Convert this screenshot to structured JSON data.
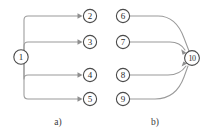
{
  "figure": {
    "width": 209,
    "height": 133,
    "background_color": "#ffffff",
    "node_stroke_color": "#4a4a4a",
    "edge_color": "#9a9a9a",
    "text_color": "#2b2b2b"
  },
  "panels": [
    {
      "id": "panel-a",
      "caption": "a)",
      "caption_x": 58,
      "caption_y": 122
    },
    {
      "id": "panel-b",
      "caption": "b)",
      "caption_x": 155,
      "caption_y": 122
    }
  ],
  "nodes": [
    {
      "id": "n1",
      "label": "1",
      "cx": 21,
      "cy": 57,
      "r": 7.2,
      "panel": "a"
    },
    {
      "id": "n2",
      "label": "2",
      "cx": 90,
      "cy": 16,
      "r": 6.6,
      "panel": "a"
    },
    {
      "id": "n3",
      "label": "3",
      "cx": 90,
      "cy": 42,
      "r": 6.6,
      "panel": "a"
    },
    {
      "id": "n4",
      "label": "4",
      "cx": 90,
      "cy": 75,
      "r": 6.6,
      "panel": "a"
    },
    {
      "id": "n5",
      "label": "5",
      "cx": 90,
      "cy": 99,
      "r": 6.6,
      "panel": "a"
    },
    {
      "id": "n6",
      "label": "6",
      "cx": 123,
      "cy": 16,
      "r": 6.6,
      "panel": "b"
    },
    {
      "id": "n7",
      "label": "7",
      "cx": 123,
      "cy": 42,
      "r": 6.6,
      "panel": "b"
    },
    {
      "id": "n8",
      "label": "8",
      "cx": 123,
      "cy": 75,
      "r": 6.6,
      "panel": "b"
    },
    {
      "id": "n9",
      "label": "9",
      "cx": 123,
      "cy": 99,
      "r": 6.6,
      "panel": "b"
    },
    {
      "id": "n10",
      "label": "10",
      "cx": 192,
      "cy": 58,
      "r": 7.4,
      "panel": "b"
    }
  ],
  "edges": [
    {
      "id": "e1-2",
      "from": "1",
      "to": "2",
      "arrow": true,
      "panel": "a"
    },
    {
      "id": "e1-3",
      "from": "1",
      "to": "3",
      "arrow": true,
      "panel": "a"
    },
    {
      "id": "e1-4",
      "from": "1",
      "to": "4",
      "arrow": true,
      "panel": "a"
    },
    {
      "id": "e1-5",
      "from": "1",
      "to": "5",
      "arrow": true,
      "panel": "a"
    },
    {
      "id": "e6-10",
      "from": "6",
      "to": "10",
      "arrow": false,
      "panel": "b"
    },
    {
      "id": "e7-10",
      "from": "7",
      "to": "10",
      "arrow": true,
      "panel": "b"
    },
    {
      "id": "e8-10",
      "from": "8",
      "to": "10",
      "arrow": true,
      "panel": "b"
    },
    {
      "id": "e9-10",
      "from": "9",
      "to": "10",
      "arrow": false,
      "panel": "b"
    }
  ],
  "edge_geometry": {
    "e1-2": "M 24,50 L 24,20 Q 24,16 28,16 L 80,16",
    "e1-3": "M 24,50 L 24,46 Q 24,42 28,42 L 80,42",
    "e1-4": "M 24,64 L 24,79 Q 24,75 28,75 L 80,75",
    "e1-5": "M 24,64 L 24,95 Q 24,99 28,99 L 80,99",
    "e6-10": "M 130,16 L 158,16 Q 176,16 184,38 L 189,51",
    "e7-10": "M 130,42 L 170,42 Q 180,42 185,50",
    "e8-10": "M 130,75 L 168,75 Q 180,75 186,66",
    "e9-10": "M 130,99 L 155,99 Q 176,99 184,77 L 188,66"
  },
  "arrow_heads": {
    "e1-2": {
      "x": 82,
      "y": 16,
      "dir": "right"
    },
    "e1-3": {
      "x": 82,
      "y": 42,
      "dir": "right"
    },
    "e1-4": {
      "x": 82,
      "y": 75,
      "dir": "right"
    },
    "e1-5": {
      "x": 82,
      "y": 99,
      "dir": "right"
    },
    "e7-10": {
      "x": 186,
      "y": 52,
      "dir": "right-down"
    },
    "e8-10": {
      "x": 187,
      "y": 64,
      "dir": "right-up"
    }
  }
}
